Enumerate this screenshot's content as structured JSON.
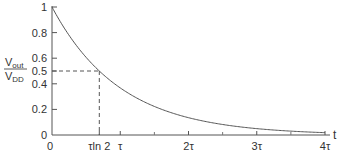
{
  "chart_data": {
    "type": "line",
    "title": "",
    "xlabel": "t",
    "ylabel_numerator": "V",
    "ylabel_numerator_sub": "out",
    "ylabel_denominator": "V",
    "ylabel_denominator_sub": "DD",
    "ylabel": "Vout/VDD",
    "xlim": [
      0,
      4
    ],
    "ylim": [
      0,
      1
    ],
    "x_ticks": [
      {
        "value": 0,
        "label": "0"
      },
      {
        "value": 0.6931,
        "label": "τln 2"
      },
      {
        "value": 1,
        "label": "τ"
      },
      {
        "value": 2,
        "label": "2τ"
      },
      {
        "value": 3,
        "label": "3τ"
      },
      {
        "value": 4,
        "label": "4τ"
      }
    ],
    "x_minor_ticks": [
      1.5,
      2.5,
      3.5
    ],
    "y_ticks": [
      {
        "value": 0,
        "label": "0"
      },
      {
        "value": 0.2,
        "label": "0.2"
      },
      {
        "value": 0.4,
        "label": "0.4"
      },
      {
        "value": 0.5,
        "label": "0.5"
      },
      {
        "value": 0.6,
        "label": "0.6"
      },
      {
        "value": 0.8,
        "label": "0.8"
      },
      {
        "value": 1,
        "label": "1"
      }
    ],
    "series": [
      {
        "name": "Vout/VDD = e^(-t/τ)",
        "function": "exp(-t)",
        "x": [
          0,
          0.5,
          0.6931,
          1,
          1.5,
          2,
          2.5,
          3,
          3.5,
          4
        ],
        "values": [
          1,
          0.607,
          0.5,
          0.368,
          0.223,
          0.135,
          0.082,
          0.05,
          0.03,
          0.018
        ]
      }
    ],
    "annotations": [
      {
        "type": "dashed-guide",
        "x": 0.6931,
        "y": 0.5,
        "description": "Half-value point at t = τln 2"
      }
    ],
    "grid": false,
    "legend": "none"
  }
}
